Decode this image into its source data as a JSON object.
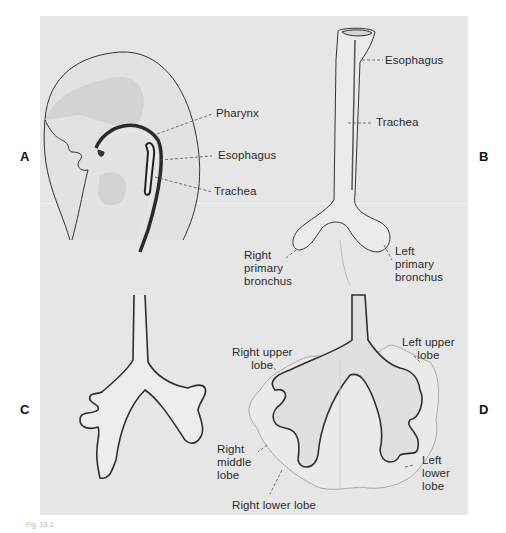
{
  "figure": {
    "panel_letters": {
      "A": "A",
      "B": "B",
      "C": "C",
      "D": "D"
    },
    "caption_fragment": "Fig. 18-1"
  },
  "panels": {
    "A": {
      "labels": {
        "pharynx": "Pharynx",
        "esophagus": "Esophagus",
        "trachea": "Trachea"
      }
    },
    "B": {
      "labels": {
        "esophagus": "Esophagus",
        "trachea": "Trachea",
        "right_primary_bronchus": [
          "Right",
          "primary",
          "bronchus"
        ],
        "left_primary_bronchus": [
          "Left",
          "primary",
          "bronchus"
        ]
      }
    },
    "C": {
      "labels": {}
    },
    "D": {
      "labels": {
        "right_upper_lobe": [
          "Right upper",
          "lobe"
        ],
        "left_upper_lobe": [
          "Left upper",
          "lobe"
        ],
        "right_middle_lobe": [
          "Right",
          "middle",
          "lobe"
        ],
        "left_lower_lobe": [
          "Left",
          "lower",
          "lobe"
        ],
        "right_lower_lobe": "Right lower lobe"
      }
    }
  },
  "colors": {
    "background": "#ffffff",
    "panel": "#e6e6e6",
    "ink": "#2b2b2b",
    "shade": "#c9c9c9"
  }
}
